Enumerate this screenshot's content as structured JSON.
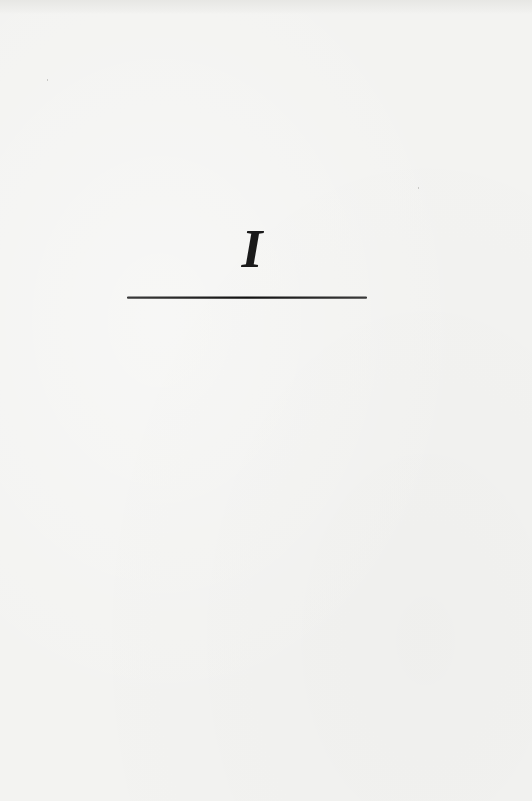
{
  "page": {
    "type": "chapter-title-page",
    "background_color": "#f3f3f1"
  },
  "chapter": {
    "numeral": "I"
  },
  "rule": {
    "color": "#1a1a1a"
  }
}
